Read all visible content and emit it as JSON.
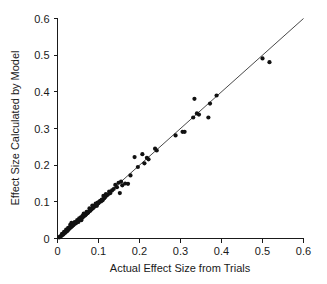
{
  "chart_data": {
    "type": "scatter",
    "title": "",
    "xlabel": "Actual Effect Size from Trials",
    "ylabel": "Effect Size Calculated by Model",
    "xlim": [
      0,
      0.6
    ],
    "ylim": [
      0,
      0.6
    ],
    "grid": false,
    "legend": null,
    "xticks": [
      "0",
      "0.1",
      "0.2",
      "0.3",
      "0.4",
      "0.5",
      "0.6"
    ],
    "xtick_values": [
      0,
      0.1,
      0.2,
      0.3,
      0.4,
      0.5,
      0.6
    ],
    "yticks": [
      "0",
      "0.1",
      "0.2",
      "0.3",
      "0.4",
      "0.5",
      "0.6"
    ],
    "ytick_values": [
      0,
      0.1,
      0.2,
      0.3,
      0.4,
      0.5,
      0.6
    ],
    "marker_color": "#111111",
    "marker_size": 2.1,
    "reference_line": {
      "name": "identity-line",
      "from": [
        0,
        0
      ],
      "to": [
        0.6,
        0.6
      ],
      "color": "#1a1a1a"
    },
    "points": [
      [
        0.004,
        0.003
      ],
      [
        0.006,
        0.005
      ],
      [
        0.008,
        0.006
      ],
      [
        0.01,
        0.008
      ],
      [
        0.011,
        0.013
      ],
      [
        0.013,
        0.01
      ],
      [
        0.015,
        0.012
      ],
      [
        0.016,
        0.018
      ],
      [
        0.018,
        0.015
      ],
      [
        0.02,
        0.017
      ],
      [
        0.021,
        0.024
      ],
      [
        0.023,
        0.02
      ],
      [
        0.025,
        0.022
      ],
      [
        0.026,
        0.029
      ],
      [
        0.028,
        0.026
      ],
      [
        0.03,
        0.028
      ],
      [
        0.031,
        0.037
      ],
      [
        0.033,
        0.031
      ],
      [
        0.034,
        0.043
      ],
      [
        0.036,
        0.034
      ],
      [
        0.038,
        0.036
      ],
      [
        0.04,
        0.038
      ],
      [
        0.042,
        0.045
      ],
      [
        0.044,
        0.041
      ],
      [
        0.046,
        0.043
      ],
      [
        0.048,
        0.05
      ],
      [
        0.05,
        0.047
      ],
      [
        0.051,
        0.045
      ],
      [
        0.053,
        0.055
      ],
      [
        0.055,
        0.052
      ],
      [
        0.057,
        0.058
      ],
      [
        0.058,
        0.05
      ],
      [
        0.06,
        0.056
      ],
      [
        0.061,
        0.062
      ],
      [
        0.063,
        0.059
      ],
      [
        0.064,
        0.068
      ],
      [
        0.066,
        0.062
      ],
      [
        0.068,
        0.064
      ],
      [
        0.07,
        0.066
      ],
      [
        0.071,
        0.073
      ],
      [
        0.073,
        0.069
      ],
      [
        0.075,
        0.071
      ],
      [
        0.077,
        0.074
      ],
      [
        0.078,
        0.082
      ],
      [
        0.08,
        0.076
      ],
      [
        0.082,
        0.079
      ],
      [
        0.084,
        0.081
      ],
      [
        0.085,
        0.09
      ],
      [
        0.087,
        0.083
      ],
      [
        0.089,
        0.086
      ],
      [
        0.091,
        0.088
      ],
      [
        0.093,
        0.095
      ],
      [
        0.095,
        0.091
      ],
      [
        0.096,
        0.089
      ],
      [
        0.098,
        0.098
      ],
      [
        0.1,
        0.096
      ],
      [
        0.102,
        0.1
      ],
      [
        0.104,
        0.103
      ],
      [
        0.106,
        0.101
      ],
      [
        0.108,
        0.106
      ],
      [
        0.11,
        0.104
      ],
      [
        0.112,
        0.116
      ],
      [
        0.114,
        0.11
      ],
      [
        0.116,
        0.113
      ],
      [
        0.118,
        0.121
      ],
      [
        0.12,
        0.117
      ],
      [
        0.123,
        0.12
      ],
      [
        0.126,
        0.128
      ],
      [
        0.129,
        0.124
      ],
      [
        0.133,
        0.131
      ],
      [
        0.137,
        0.135
      ],
      [
        0.141,
        0.146
      ],
      [
        0.145,
        0.14
      ],
      [
        0.149,
        0.152
      ],
      [
        0.152,
        0.124
      ],
      [
        0.155,
        0.155
      ],
      [
        0.158,
        0.145
      ],
      [
        0.165,
        0.15
      ],
      [
        0.172,
        0.149
      ],
      [
        0.178,
        0.172
      ],
      [
        0.188,
        0.222
      ],
      [
        0.196,
        0.195
      ],
      [
        0.207,
        0.23
      ],
      [
        0.212,
        0.205
      ],
      [
        0.218,
        0.22
      ],
      [
        0.222,
        0.216
      ],
      [
        0.238,
        0.245
      ],
      [
        0.242,
        0.24
      ],
      [
        0.288,
        0.281
      ],
      [
        0.305,
        0.291
      ],
      [
        0.31,
        0.291
      ],
      [
        0.331,
        0.33
      ],
      [
        0.334,
        0.381
      ],
      [
        0.34,
        0.341
      ],
      [
        0.345,
        0.338
      ],
      [
        0.368,
        0.33
      ],
      [
        0.372,
        0.368
      ],
      [
        0.388,
        0.39
      ],
      [
        0.5,
        0.491
      ],
      [
        0.517,
        0.481
      ]
    ]
  }
}
